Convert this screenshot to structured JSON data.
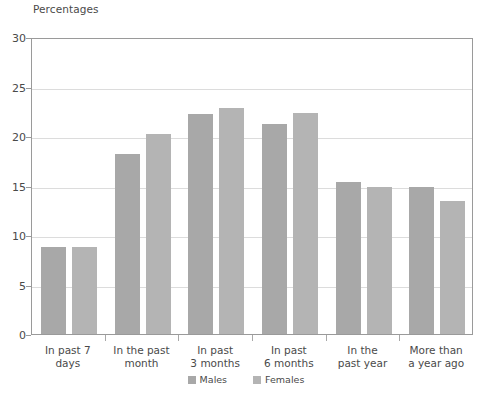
{
  "chart_data": {
    "type": "bar",
    "title": "Percentages",
    "xlabel": "",
    "ylabel": "Percentages",
    "ylim": [
      0,
      30
    ],
    "yticks": [
      0,
      5,
      10,
      15,
      20,
      25,
      30
    ],
    "grid": true,
    "legend_position": "bottom",
    "categories": [
      "In past 7 days",
      "In the past month",
      "In past 3 months",
      "In past 6 months",
      "In the past year",
      "More than a year ago"
    ],
    "category_lines": [
      [
        "In past 7 days"
      ],
      [
        "In the past",
        "month"
      ],
      [
        "In past",
        "3 months"
      ],
      [
        "In past",
        "6 months"
      ],
      [
        "In the",
        "past year"
      ],
      [
        "More than",
        "a year ago"
      ]
    ],
    "series": [
      {
        "name": "Males",
        "color": "#a8a8a8",
        "values": [
          8.8,
          18.2,
          22.2,
          21.2,
          15.4,
          14.9
        ]
      },
      {
        "name": "Females",
        "color": "#b4b4b4",
        "values": [
          8.8,
          20.2,
          22.8,
          22.3,
          14.9,
          13.4
        ]
      }
    ]
  },
  "legend": {
    "items": [
      {
        "label": "Males",
        "color": "#a8a8a8"
      },
      {
        "label": "Females",
        "color": "#b4b4b4"
      }
    ]
  },
  "axis": {
    "y_tick_labels": [
      "30",
      "25",
      "20",
      "15",
      "10",
      "5",
      "0"
    ]
  },
  "colors": {
    "males_bar": "#a8a8a8",
    "females_bar": "#b4b4b4",
    "gridline": "#dcdcdc",
    "plot_border": "#9a9a9a",
    "text": "#4a4a4a",
    "background": "#ffffff"
  }
}
